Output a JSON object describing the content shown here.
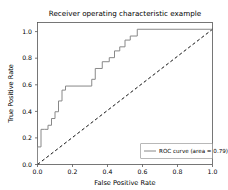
{
  "chart_data": {
    "type": "line",
    "title": "Receiver operating characteristic example",
    "xlabel": "False Positive Rate",
    "ylabel": "True Positive Rate",
    "xlim": [
      0.0,
      1.0
    ],
    "ylim": [
      0.0,
      1.05
    ],
    "grid": false,
    "legend_position": "lower right",
    "xticks": [
      "0.0",
      "0.2",
      "0.4",
      "0.6",
      "0.8",
      "1.0"
    ],
    "xtick_values": [
      0.0,
      0.2,
      0.4,
      0.6,
      0.8,
      1.0
    ],
    "yticks": [
      "0.0",
      "0.2",
      "0.4",
      "0.6",
      "0.8",
      "1.0"
    ],
    "ytick_values": [
      0.0,
      0.2,
      0.4,
      0.6,
      0.8,
      1.0
    ],
    "series": [
      {
        "name": "ROC curve (area = 0.79)",
        "style": "solid",
        "color": "#888888",
        "area": 0.79,
        "x": [
          0.0,
          0.0,
          0.02,
          0.02,
          0.04,
          0.04,
          0.06,
          0.06,
          0.08,
          0.08,
          0.1,
          0.1,
          0.12,
          0.12,
          0.14,
          0.14,
          0.16,
          0.16,
          0.31,
          0.31,
          0.33,
          0.33,
          0.37,
          0.37,
          0.41,
          0.41,
          0.44,
          0.44,
          0.47,
          0.47,
          0.5,
          0.5,
          0.53,
          0.53,
          0.57,
          0.57,
          1.0
        ],
        "y": [
          0.0,
          0.13,
          0.13,
          0.26,
          0.26,
          0.26,
          0.26,
          0.29,
          0.29,
          0.34,
          0.34,
          0.39,
          0.39,
          0.47,
          0.47,
          0.55,
          0.55,
          0.58,
          0.58,
          0.63,
          0.63,
          0.71,
          0.71,
          0.76,
          0.76,
          0.79,
          0.79,
          0.84,
          0.84,
          0.87,
          0.87,
          0.92,
          0.92,
          0.95,
          0.95,
          1.0,
          1.0
        ]
      },
      {
        "name": "chance-diagonal",
        "style": "dashed",
        "color": "#111111",
        "x": [
          0.0,
          1.0
        ],
        "y": [
          0.0,
          1.0
        ]
      }
    ],
    "legend_entries": [
      {
        "label": "ROC curve (area = 0.79)",
        "color": "#888888",
        "style": "solid"
      }
    ]
  }
}
